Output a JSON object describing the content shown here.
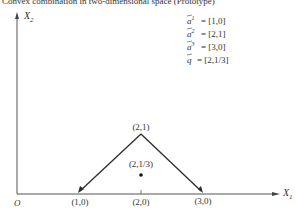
{
  "caption_fragment": "Convex combination in two-dimensional space (Prototype)",
  "axes": {
    "x_label": "X",
    "x_sub": "1",
    "y_label": "X",
    "y_sub": "2",
    "origin_label": "O"
  },
  "points": [
    {
      "id": "a1",
      "label": "(1,0)",
      "x": 1,
      "y": 0
    },
    {
      "id": "a2",
      "label": "(2,1)",
      "x": 2,
      "y": 1
    },
    {
      "id": "a3",
      "label": "(3,0)",
      "x": 3,
      "y": 0
    },
    {
      "id": "q",
      "label": "(2,1/3)",
      "x": 2,
      "y": 0.3333
    },
    {
      "id": "tick",
      "label": "(2,0)",
      "x": 2,
      "y": 0
    }
  ],
  "legend": [
    {
      "sym": "a",
      "sup": "1",
      "value": "= [1,0]"
    },
    {
      "sym": "a",
      "sup": "2",
      "value": "= [2,1]"
    },
    {
      "sym": "a",
      "sup": "3",
      "value": "= [3,0]"
    },
    {
      "sym": "q",
      "sup": "",
      "value": "= [2,1/3]"
    }
  ],
  "colors": {
    "line": "#2b2b2b",
    "axis": "#555555",
    "text": "#333333"
  }
}
